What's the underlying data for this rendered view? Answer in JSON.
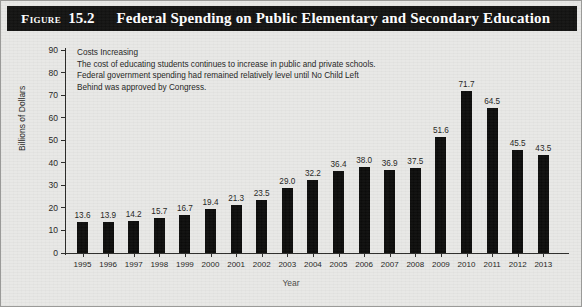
{
  "figure": {
    "label": "Figure",
    "number": "15.2",
    "title": "Federal Spending on Public Elementary and Secondary Education"
  },
  "annotation": {
    "heading": "Costs Increasing",
    "lines": [
      "The cost of educating students continues to increase in public and private schools.",
      "Federal government spending had remained relatively level until No Child Left",
      "Behind was approved by Congress."
    ]
  },
  "chart_data": {
    "type": "bar",
    "title": "Federal Spending on Public Elementary and Secondary Education",
    "xlabel": "Year",
    "ylabel": "Billions of Dollars",
    "ylim": [
      0,
      90
    ],
    "yticks": [
      0,
      10,
      20,
      30,
      40,
      50,
      60,
      70,
      80,
      90
    ],
    "grid": false,
    "legend": "none",
    "bar_color": "#0b0b0a",
    "categories": [
      "1995",
      "1996",
      "1997",
      "1998",
      "1999",
      "2000",
      "2001",
      "2002",
      "2003",
      "2004",
      "2005",
      "2006",
      "2007",
      "2008",
      "2009",
      "2010",
      "2011",
      "2012",
      "2013"
    ],
    "values": [
      13.6,
      13.9,
      14.2,
      15.7,
      16.7,
      19.4,
      21.3,
      23.5,
      29.0,
      32.2,
      36.4,
      38.0,
      36.9,
      37.5,
      51.6,
      71.7,
      64.5,
      45.5,
      43.5
    ],
    "value_labels": [
      "13.6",
      "13.9",
      "14.2",
      "15.7",
      "16.7",
      "19.4",
      "21.3",
      "23.5",
      "29.0",
      "32.2",
      "36.4",
      "38.0",
      "36.9",
      "37.5",
      "51.6",
      "71.7",
      "64.5",
      "45.5",
      "43.5"
    ]
  }
}
